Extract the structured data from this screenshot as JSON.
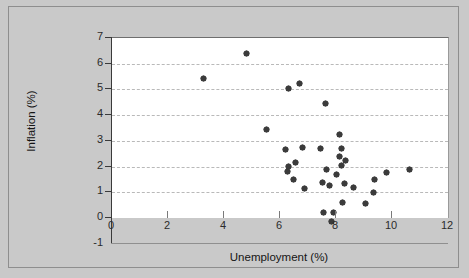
{
  "chart_data": {
    "type": "scatter",
    "title": "",
    "xlabel": "Unemployment (%)",
    "ylabel": "Inflation (%)",
    "xlim": [
      0,
      12
    ],
    "ylim": [
      -1,
      7
    ],
    "xticks": [
      0,
      2,
      4,
      6,
      8,
      10,
      12
    ],
    "yticks": [
      -1,
      0,
      1,
      2,
      3,
      4,
      5,
      6,
      7
    ],
    "xtick_labels": [
      "0",
      "2",
      "4",
      "6",
      "8",
      "10",
      "12"
    ],
    "ytick_labels": [
      "-1",
      "0",
      "1",
      "2",
      "3",
      "4",
      "5",
      "6",
      "7"
    ],
    "grid": "horizontal-dashed",
    "legend": "none",
    "marker": "diamond",
    "marker_color": "#3b3b3b",
    "plot_background": "#ffffff",
    "figure_background": "#c9c9c9",
    "points": [
      {
        "x": 3.25,
        "y": 5.41
      },
      {
        "x": 4.82,
        "y": 6.38
      },
      {
        "x": 6.32,
        "y": 5.02
      },
      {
        "x": 6.68,
        "y": 5.25
      },
      {
        "x": 7.64,
        "y": 4.47
      },
      {
        "x": 5.52,
        "y": 3.45
      },
      {
        "x": 8.14,
        "y": 3.26
      },
      {
        "x": 6.18,
        "y": 2.68
      },
      {
        "x": 6.82,
        "y": 2.74
      },
      {
        "x": 7.43,
        "y": 2.72
      },
      {
        "x": 8.21,
        "y": 2.7
      },
      {
        "x": 8.11,
        "y": 2.38
      },
      {
        "x": 6.54,
        "y": 2.17
      },
      {
        "x": 8.35,
        "y": 2.25
      },
      {
        "x": 6.29,
        "y": 2.0
      },
      {
        "x": 8.18,
        "y": 2.05
      },
      {
        "x": 7.66,
        "y": 1.89
      },
      {
        "x": 9.82,
        "y": 1.76
      },
      {
        "x": 10.62,
        "y": 1.9
      },
      {
        "x": 6.27,
        "y": 1.8
      },
      {
        "x": 8.0,
        "y": 1.7
      },
      {
        "x": 9.39,
        "y": 1.5
      },
      {
        "x": 6.48,
        "y": 1.51
      },
      {
        "x": 8.32,
        "y": 1.33
      },
      {
        "x": 7.5,
        "y": 1.37
      },
      {
        "x": 7.78,
        "y": 1.25
      },
      {
        "x": 8.63,
        "y": 1.17
      },
      {
        "x": 6.87,
        "y": 1.13
      },
      {
        "x": 9.34,
        "y": 1.0
      },
      {
        "x": 8.22,
        "y": 0.62
      },
      {
        "x": 9.07,
        "y": 0.58
      },
      {
        "x": 7.55,
        "y": 0.22
      },
      {
        "x": 7.9,
        "y": 0.22
      },
      {
        "x": 7.84,
        "y": -0.14
      }
    ]
  },
  "axes": {
    "x_title": "Unemployment (%)",
    "y_title": "Inflation (%)"
  }
}
